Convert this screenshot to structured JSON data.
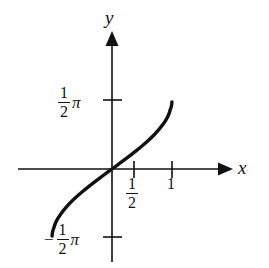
{
  "figure": {
    "background_color": "#ffffff",
    "ink_color": "#111111",
    "axis_labels": {
      "x": "x",
      "y": "y"
    },
    "tick_labels": {
      "y_positive": {
        "minus": "",
        "numerator": "1",
        "denominator": "2",
        "symbol": "π"
      },
      "y_negative": {
        "minus": "−",
        "numerator": "1",
        "denominator": "2",
        "symbol": "π"
      },
      "x_half": {
        "numerator": "1",
        "denominator": "2"
      },
      "x_one": "1"
    }
  },
  "chart_data": {
    "type": "line",
    "title": "",
    "xlabel": "x",
    "ylabel": "y",
    "xlim": [
      -0.75,
      1.6
    ],
    "ylim": [
      -2.2,
      2.2
    ],
    "grid": false,
    "legend": null,
    "x_ticks": [
      0.5,
      1
    ],
    "x_tick_labels": [
      "1/2",
      "1"
    ],
    "y_ticks": [
      1.5708,
      -1.5708
    ],
    "y_tick_labels": [
      "(1/2)π",
      "-(1/2)π"
    ],
    "axis_arrows": {
      "x": "right",
      "y": "up"
    },
    "series": [
      {
        "name": "arcsin(x)",
        "description": "S-shaped increasing curve through the origin, steepening toward the endpoints",
        "x": [
          -0.999,
          -0.99,
          -0.97,
          -0.94,
          -0.9,
          -0.85,
          -0.78,
          -0.7,
          -0.6,
          -0.5,
          -0.4,
          -0.3,
          -0.2,
          -0.1,
          0.0,
          0.1,
          0.2,
          0.3,
          0.4,
          0.5,
          0.6,
          0.7,
          0.78,
          0.85,
          0.9,
          0.94,
          0.97,
          0.99,
          0.999
        ],
        "y": [
          -1.5261,
          -1.4289,
          -1.3453,
          -1.2239,
          -1.1198,
          -1.016,
          -0.8946,
          -0.7754,
          -0.6435,
          -0.5236,
          -0.4115,
          -0.3047,
          -0.2014,
          -0.1002,
          0.0,
          0.1002,
          0.2014,
          0.3047,
          0.4115,
          0.5236,
          0.6435,
          0.7754,
          0.8946,
          1.016,
          1.1198,
          1.2239,
          1.3453,
          1.4289,
          1.5261
        ]
      }
    ]
  }
}
